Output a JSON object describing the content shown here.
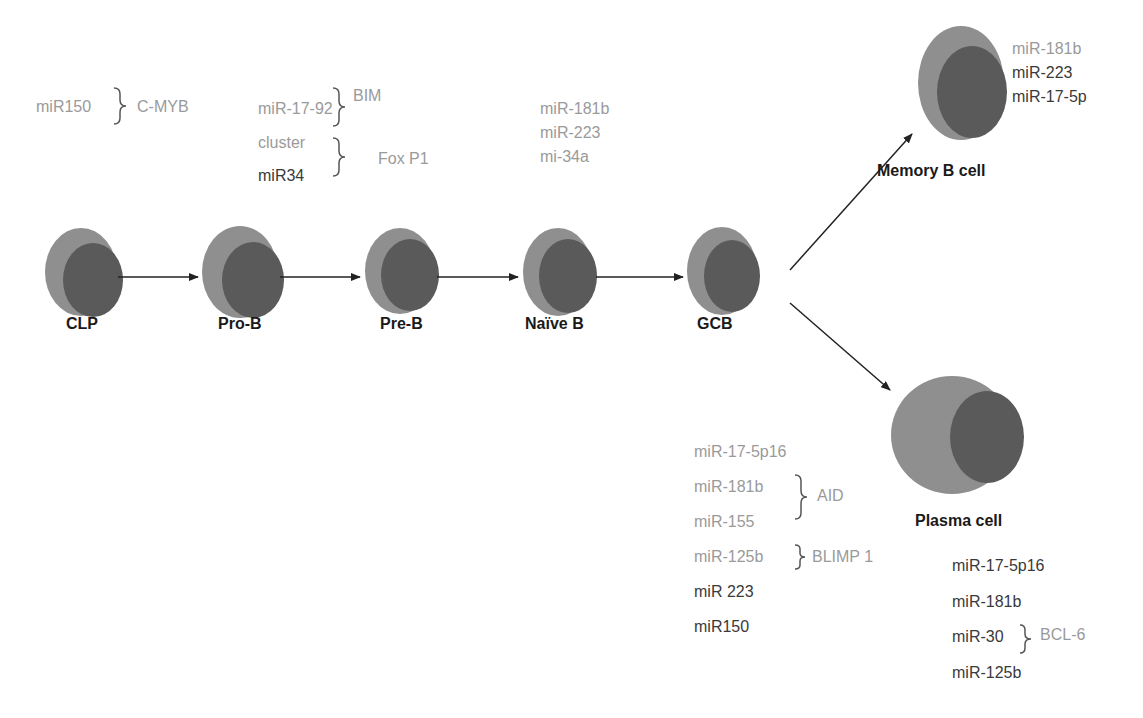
{
  "diagram": {
    "colors": {
      "cell_outer": "#8f8f8f",
      "cell_nucleus": "#5a5a5a",
      "arrow": "#222222",
      "gray_text": "#9a9a9a",
      "dark_text": "#3a3a3a",
      "stage_label": "#1a1a1a"
    },
    "stages": [
      {
        "id": "clp",
        "label": "CLP"
      },
      {
        "id": "pro-b",
        "label": "Pro-B"
      },
      {
        "id": "pre-b",
        "label": "Pre-B"
      },
      {
        "id": "naive-b",
        "label": "Naïve B"
      },
      {
        "id": "gcb",
        "label": "GCB"
      },
      {
        "id": "memory-b",
        "label": "Memory B cell"
      },
      {
        "id": "plasma",
        "label": "Plasma cell"
      }
    ],
    "annotations": {
      "clp": {
        "mirna": "miR150",
        "target": "C-MYB"
      },
      "pro_b": {
        "group1": {
          "mirnas": [
            "miR-17-92"
          ],
          "target": "BIM"
        },
        "group2": {
          "mirnas": [
            "cluster",
            "miR34"
          ],
          "target": "Fox P1"
        }
      },
      "naive_b": {
        "mirnas": [
          "miR-181b",
          "miR-223",
          "mi-34a"
        ]
      },
      "memory_b": {
        "mirnas": [
          "miR-181b",
          "miR-223",
          "miR-17-5p"
        ]
      },
      "gcb": {
        "mirnas": [
          "miR-17-5p16",
          "miR-181b",
          "miR-155",
          "miR-125b",
          "miR 223",
          "miR150"
        ],
        "targets": [
          {
            "label": "AID",
            "applies_to": [
              "miR-181b",
              "miR-155"
            ]
          },
          {
            "label": "BLIMP 1",
            "applies_to": [
              "miR-125b"
            ]
          }
        ]
      },
      "plasma": {
        "mirnas": [
          "miR-17-5p16",
          "miR-181b",
          "miR-30",
          "miR-125b"
        ],
        "targets": [
          {
            "label": "BCL-6",
            "applies_to": [
              "miR-30"
            ]
          }
        ]
      }
    }
  }
}
